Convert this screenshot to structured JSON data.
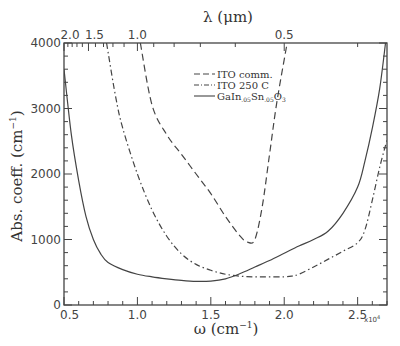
{
  "chart_data": {
    "type": "line",
    "title": "",
    "xlabel": "ω (cm⁻¹)",
    "x_scale_note": "x10⁴",
    "ylabel": "Abs. coeff. (cm⁻¹)",
    "top_xlabel": "λ (μm)",
    "xlim": [
      0.5,
      2.7
    ],
    "ylim": [
      0,
      4000
    ],
    "x_ticks": [
      "0.5",
      "1.0",
      "1.5",
      "2.0",
      "2.5"
    ],
    "y_ticks": [
      "0",
      "1000",
      "2000",
      "3000",
      "4000"
    ],
    "top_ticks": [
      "2.0",
      "1.5",
      "1.0",
      "0.5"
    ],
    "top_tick_positions_um": [
      2.0,
      1.5,
      1.0,
      0.5
    ],
    "grid": false,
    "legend_position": "upper center",
    "series": [
      {
        "name": "ITO comm.",
        "style": "dashed",
        "x": [
          1.02,
          1.1,
          1.2,
          1.3,
          1.4,
          1.5,
          1.6,
          1.7,
          1.75,
          1.8,
          1.85,
          1.9,
          1.95,
          2.02
        ],
        "values": [
          4000,
          3050,
          2600,
          2300,
          2000,
          1700,
          1350,
          1050,
          960,
          1000,
          1500,
          2300,
          3100,
          4000
        ]
      },
      {
        "name": "ITO 250 C",
        "style": "dash-dot",
        "x": [
          0.79,
          0.85,
          0.9,
          1.0,
          1.1,
          1.2,
          1.3,
          1.4,
          1.5,
          1.6,
          1.7,
          1.8,
          1.9,
          2.0,
          2.05,
          2.1,
          2.2,
          2.3,
          2.4,
          2.5,
          2.55,
          2.6,
          2.65,
          2.7
        ],
        "values": [
          4000,
          3200,
          2700,
          2000,
          1450,
          1050,
          780,
          620,
          530,
          470,
          440,
          430,
          430,
          430,
          440,
          470,
          580,
          700,
          820,
          950,
          1150,
          1600,
          2100,
          2520
        ]
      },
      {
        "name": "GaIn.05Sn.05O3",
        "style": "solid",
        "x": [
          0.5,
          0.55,
          0.6,
          0.65,
          0.7,
          0.75,
          0.8,
          0.9,
          1.0,
          1.1,
          1.2,
          1.3,
          1.4,
          1.5,
          1.6,
          1.7,
          1.8,
          1.9,
          2.0,
          2.1,
          2.2,
          2.3,
          2.4,
          2.5,
          2.55,
          2.6,
          2.65,
          2.69
        ],
        "values": [
          3600,
          2600,
          1900,
          1350,
          1000,
          780,
          650,
          540,
          470,
          430,
          400,
          375,
          360,
          365,
          400,
          480,
          580,
          680,
          790,
          900,
          1000,
          1130,
          1400,
          1800,
          2200,
          2700,
          3300,
          4000
        ]
      }
    ]
  },
  "labels": {
    "ylabel": "Abs. coeff. (cm",
    "ylabel_sup": "−1",
    "ylabel_end": ")",
    "xlabel": "ω (cm",
    "xlabel_sup": "−1",
    "xlabel_end": ")",
    "top_xlabel": "λ (μm)",
    "sci_note": "x10",
    "sci_exp": "4"
  },
  "legend": {
    "items": [
      {
        "label": "ITO comm."
      },
      {
        "label": "ITO 250 C"
      },
      {
        "label_main": "GaIn",
        "sub1": ".05",
        "mid": "Sn",
        "sub2": ".05",
        "tail": "O",
        "sub3": "3"
      }
    ]
  }
}
